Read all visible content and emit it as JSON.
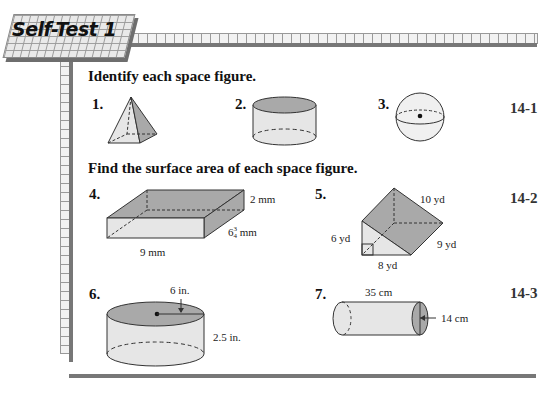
{
  "header": {
    "title": "Self-Test 1"
  },
  "sections": [
    {
      "heading": "Identify each space figure.",
      "lesson": "14-1",
      "items": [
        {
          "number": "1.",
          "figure": "square pyramid"
        },
        {
          "number": "2.",
          "figure": "cylinder"
        },
        {
          "number": "3.",
          "figure": "sphere"
        }
      ]
    },
    {
      "heading": "Find the surface area of each space figure.",
      "items": [
        {
          "number": "4.",
          "figure": "rectangular prism",
          "labels": {
            "height": "2 mm",
            "width_whole": "6",
            "width_num": "3",
            "width_den": "4",
            "width_unit": "mm",
            "length": "9 mm"
          }
        },
        {
          "number": "5.",
          "figure": "triangular prism",
          "labels": {
            "slant": "10 yd",
            "height": "6 yd",
            "base": "8 yd",
            "length": "9 yd"
          }
        },
        {
          "number": "6.",
          "figure": "cylinder",
          "labels": {
            "radius": "6 in.",
            "height": "2.5 in."
          }
        },
        {
          "number": "7.",
          "figure": "cylinder (horizontal)",
          "labels": {
            "length": "35 cm",
            "diameter": "14 cm"
          }
        }
      ],
      "lessons": [
        "14-2",
        "14-3"
      ]
    }
  ]
}
